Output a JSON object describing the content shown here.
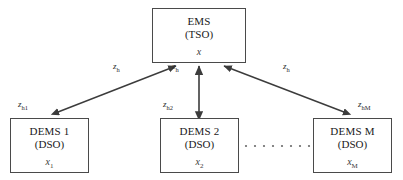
{
  "diagram": {
    "nodes": {
      "ems": {
        "title": "EMS",
        "subtitle": "(TSO)",
        "variable": "x",
        "variable_sub": ""
      },
      "dems1": {
        "title": "DEMS 1",
        "subtitle": "(DSO)",
        "variable": "x",
        "variable_sub": "1"
      },
      "dems2": {
        "title": "DEMS 2",
        "subtitle": "(DSO)",
        "variable": "x",
        "variable_sub": "2"
      },
      "demsM": {
        "title": "DEMS M",
        "subtitle": "(DSO)",
        "variable": "x",
        "variable_sub": "M"
      }
    },
    "edge_labels": {
      "zh_left": {
        "base": "z",
        "sub": "h"
      },
      "zh_mid": {
        "base": "z",
        "sub": "h"
      },
      "zh_right": {
        "base": "z",
        "sub": "h"
      },
      "zh1": {
        "base": "z",
        "sub": "h1"
      },
      "zh2": {
        "base": "z",
        "sub": "h2"
      },
      "zhM": {
        "base": "z",
        "sub": "hM"
      }
    },
    "ellipsis": {
      "label": "continuation-dots",
      "dot_count": 8
    },
    "colors": {
      "box_border": "#4a4a4a",
      "arrow": "#3c3c3c",
      "text": "#1a1a1a",
      "background": "#ffffff",
      "dots": "#6a6a6a"
    }
  }
}
